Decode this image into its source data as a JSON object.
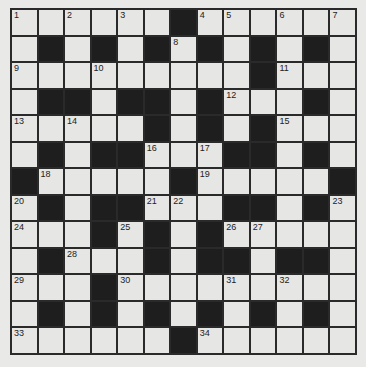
{
  "puzzle": {
    "size": 13,
    "layout": [
      "######.######",
      "#.#.#.#.#.#.#",
      "#########.###",
      "#..#..#.###.#",
      "#####.#.#.###",
      "#.#..###..#.#",
      ".#####.#####.",
      "#.#..###..#.#",
      "###.#.#.#####",
      "#.###.#..#..#",
      "###.#########",
      "#.#.#.#.#.#.#",
      "######.######"
    ],
    "numbers": [
      {
        "r": 0,
        "c": 0,
        "n": "1"
      },
      {
        "r": 0,
        "c": 2,
        "n": "2"
      },
      {
        "r": 0,
        "c": 4,
        "n": "3"
      },
      {
        "r": 0,
        "c": 7,
        "n": "4"
      },
      {
        "r": 0,
        "c": 8,
        "n": "5"
      },
      {
        "r": 0,
        "c": 10,
        "n": "6"
      },
      {
        "r": 0,
        "c": 12,
        "n": "7"
      },
      {
        "r": 1,
        "c": 6,
        "n": "8"
      },
      {
        "r": 2,
        "c": 0,
        "n": "9"
      },
      {
        "r": 2,
        "c": 3,
        "n": "10"
      },
      {
        "r": 2,
        "c": 10,
        "n": "11"
      },
      {
        "r": 3,
        "c": 8,
        "n": "12"
      },
      {
        "r": 4,
        "c": 0,
        "n": "13"
      },
      {
        "r": 4,
        "c": 2,
        "n": "14"
      },
      {
        "r": 4,
        "c": 10,
        "n": "15"
      },
      {
        "r": 5,
        "c": 5,
        "n": "16"
      },
      {
        "r": 5,
        "c": 7,
        "n": "17"
      },
      {
        "r": 6,
        "c": 1,
        "n": "18"
      },
      {
        "r": 6,
        "c": 7,
        "n": "19"
      },
      {
        "r": 7,
        "c": 0,
        "n": "20"
      },
      {
        "r": 7,
        "c": 5,
        "n": "21"
      },
      {
        "r": 7,
        "c": 6,
        "n": "22"
      },
      {
        "r": 7,
        "c": 12,
        "n": "23"
      },
      {
        "r": 8,
        "c": 0,
        "n": "24"
      },
      {
        "r": 8,
        "c": 4,
        "n": "25"
      },
      {
        "r": 8,
        "c": 8,
        "n": "26"
      },
      {
        "r": 8,
        "c": 9,
        "n": "27"
      },
      {
        "r": 9,
        "c": 2,
        "n": "28"
      },
      {
        "r": 10,
        "c": 0,
        "n": "29"
      },
      {
        "r": 10,
        "c": 4,
        "n": "30"
      },
      {
        "r": 10,
        "c": 8,
        "n": "31"
      },
      {
        "r": 10,
        "c": 10,
        "n": "32"
      },
      {
        "r": 12,
        "c": 0,
        "n": "33"
      },
      {
        "r": 12,
        "c": 7,
        "n": "34"
      }
    ]
  },
  "colors": {
    "background": "#e9e9e7",
    "cell": "#e6e6e4",
    "block": "#1e1e1e",
    "gridline": "#2a2a2a"
  }
}
